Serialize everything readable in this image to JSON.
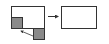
{
  "diagram": {
    "colors": {
      "stroke": "#333333",
      "block_fill": "#8a8a8a",
      "background": "#ffffff"
    },
    "nodes": [
      {
        "id": "frame-before",
        "label": ""
      },
      {
        "id": "inner-block",
        "label": ""
      },
      {
        "id": "outer-block",
        "label": ""
      },
      {
        "id": "frame-after",
        "label": ""
      }
    ],
    "edges": [
      {
        "from": "outer-block",
        "to": "inner-block",
        "type": "arrow"
      },
      {
        "from": "frame-before",
        "to": "frame-after",
        "type": "arrow"
      }
    ]
  }
}
